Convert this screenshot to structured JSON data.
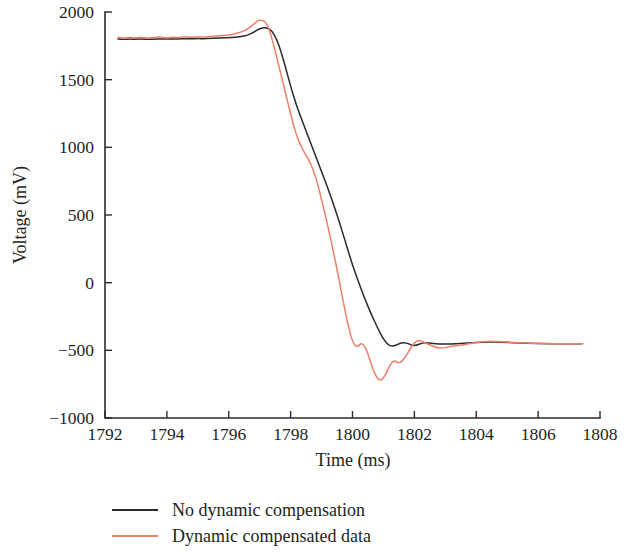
{
  "chart_data": {
    "type": "line",
    "title": "",
    "xlabel": "Time (ms)",
    "ylabel": "Voltage (mV)",
    "xlim": [
      1792,
      1808
    ],
    "ylim": [
      -1000,
      2000
    ],
    "xticks": [
      1792,
      1794,
      1796,
      1798,
      1800,
      1802,
      1804,
      1806,
      1808
    ],
    "yticks": [
      -1000,
      -500,
      0,
      500,
      1000,
      1500,
      2000
    ],
    "xtick_labels": [
      "1792",
      "1794",
      "1796",
      "1798",
      "1800",
      "1802",
      "1804",
      "1806",
      "1808"
    ],
    "ytick_labels": [
      "−1000",
      "−500",
      "0",
      "500",
      "1000",
      "1500",
      "2000"
    ],
    "grid": false,
    "legend_position": "below",
    "colors": {
      "no_dynamic_compensation": "#2a2a2a",
      "dynamic_compensated_data": "#ee7f6a",
      "axis": "#2b2b2b",
      "text": "#231f20",
      "background": "#ffffff"
    },
    "series": [
      {
        "name": "No dynamic compensation",
        "color": "#2a2a2a",
        "x": [
          1792.42,
          1792.6,
          1792.8,
          1793.0,
          1793.2,
          1793.4,
          1793.6,
          1793.8,
          1794.0,
          1794.2,
          1794.4,
          1794.6,
          1794.8,
          1795.0,
          1795.2,
          1795.4,
          1795.6,
          1795.8,
          1796.0,
          1796.2,
          1796.4,
          1796.6,
          1796.8,
          1796.95,
          1797.1,
          1797.25,
          1797.4,
          1797.55,
          1797.7,
          1797.85,
          1798.0,
          1798.2,
          1798.4,
          1798.6,
          1798.8,
          1799.0,
          1799.2,
          1799.4,
          1799.6,
          1799.8,
          1800.0,
          1800.2,
          1800.4,
          1800.6,
          1800.8,
          1801.0,
          1801.2,
          1801.4,
          1801.6,
          1801.8,
          1802.0,
          1802.3,
          1802.6,
          1803.0,
          1803.4,
          1803.8,
          1804.2,
          1804.6,
          1805.0,
          1805.4,
          1805.8,
          1806.2,
          1806.6,
          1807.0,
          1807.4
        ],
        "y": [
          1800,
          1798,
          1800,
          1799,
          1801,
          1798,
          1800,
          1802,
          1799,
          1801,
          1800,
          1803,
          1801,
          1804,
          1802,
          1805,
          1806,
          1808,
          1810,
          1812,
          1818,
          1828,
          1848,
          1872,
          1884,
          1882,
          1860,
          1800,
          1700,
          1580,
          1450,
          1300,
          1180,
          1060,
          940,
          820,
          700,
          570,
          430,
          280,
          130,
          0,
          -120,
          -230,
          -330,
          -420,
          -470,
          -465,
          -440,
          -450,
          -470,
          -440,
          -450,
          -455,
          -450,
          -445,
          -440,
          -438,
          -442,
          -446,
          -448,
          -450,
          -452,
          -452,
          -452
        ]
      },
      {
        "name": "Dynamic compensated data",
        "color": "#ee7f6a",
        "x": [
          1792.42,
          1792.6,
          1792.8,
          1793.0,
          1793.2,
          1793.4,
          1793.6,
          1793.8,
          1794.0,
          1794.2,
          1794.4,
          1794.6,
          1794.8,
          1795.0,
          1795.2,
          1795.4,
          1795.6,
          1795.8,
          1796.0,
          1796.2,
          1796.4,
          1796.6,
          1796.8,
          1796.92,
          1797.05,
          1797.18,
          1797.3,
          1797.45,
          1797.6,
          1797.75,
          1797.9,
          1798.05,
          1798.2,
          1798.35,
          1798.5,
          1798.65,
          1798.8,
          1798.95,
          1799.1,
          1799.25,
          1799.4,
          1799.55,
          1799.7,
          1799.85,
          1800.0,
          1800.15,
          1800.3,
          1800.45,
          1800.6,
          1800.75,
          1800.9,
          1801.05,
          1801.2,
          1801.35,
          1801.5,
          1801.7,
          1801.9,
          1802.1,
          1802.4,
          1802.8,
          1803.2,
          1803.6,
          1804.0,
          1804.4,
          1804.8,
          1805.2,
          1805.6,
          1806.0,
          1806.4,
          1806.8,
          1807.2,
          1807.45
        ],
        "y": [
          1812,
          1806,
          1812,
          1808,
          1814,
          1806,
          1812,
          1816,
          1808,
          1814,
          1810,
          1818,
          1812,
          1818,
          1814,
          1820,
          1822,
          1826,
          1830,
          1838,
          1852,
          1872,
          1908,
          1935,
          1942,
          1930,
          1880,
          1760,
          1620,
          1480,
          1340,
          1200,
          1080,
          1000,
          940,
          880,
          790,
          660,
          520,
          370,
          210,
          40,
          -140,
          -310,
          -440,
          -480,
          -440,
          -490,
          -600,
          -690,
          -730,
          -690,
          -610,
          -570,
          -600,
          -560,
          -470,
          -420,
          -450,
          -490,
          -470,
          -460,
          -440,
          -432,
          -436,
          -442,
          -446,
          -448,
          -450,
          -452,
          -452,
          -452
        ]
      }
    ]
  },
  "legend": {
    "items": [
      {
        "label": "No dynamic compensation",
        "color": "#2a2a2a"
      },
      {
        "label": "Dynamic compensated data",
        "color": "#ee7f6a"
      }
    ]
  }
}
